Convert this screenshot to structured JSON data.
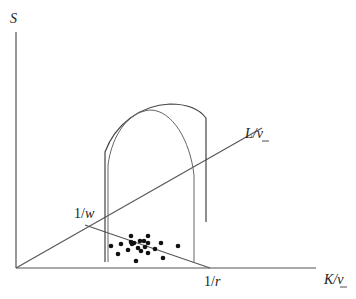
{
  "diagram": {
    "type": "3D economic diagram",
    "axes": {
      "vertical": {
        "label": "S"
      },
      "horizontal": {
        "label_main": "K/",
        "label_sub": "v"
      },
      "diagonal": {
        "label_main": "L/",
        "label_sub": "v"
      }
    },
    "intercepts": {
      "diagonal_intercept": {
        "prefix": "1/",
        "var": "w"
      },
      "horizontal_intercept": {
        "prefix": "1/",
        "var": "r"
      }
    },
    "colors": {
      "line": "#555555",
      "curve": "#444444",
      "dot": "#111111",
      "text": "#222222"
    },
    "points": [
      [
        111,
        246
      ],
      [
        121,
        244
      ],
      [
        131,
        236
      ],
      [
        131,
        242
      ],
      [
        132,
        244
      ],
      [
        134,
        243
      ],
      [
        140,
        241
      ],
      [
        144,
        241
      ],
      [
        148,
        236
      ],
      [
        148,
        243
      ],
      [
        138,
        248
      ],
      [
        145,
        247
      ],
      [
        128,
        250
      ],
      [
        141,
        251
      ],
      [
        148,
        253
      ],
      [
        155,
        249
      ],
      [
        161,
        243
      ],
      [
        178,
        246
      ],
      [
        118,
        254
      ],
      [
        163,
        258
      ],
      [
        136,
        261
      ]
    ]
  }
}
